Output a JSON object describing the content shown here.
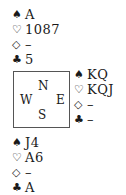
{
  "diagram": {
    "type": "bridge-deal",
    "compass": {
      "north": "N",
      "west": "W",
      "east": "E",
      "south": "S"
    },
    "suit_symbols": {
      "spades": "♠",
      "hearts": "♡",
      "diamonds": "◇",
      "clubs": "♣"
    },
    "hands": {
      "north": {
        "spades": "A",
        "hearts": "1087",
        "diamonds": "–",
        "clubs": "5"
      },
      "east": {
        "spades": "KQ",
        "hearts": "KQJ",
        "diamonds": "–",
        "clubs": "–"
      },
      "south": {
        "spades": "J4",
        "hearts": "A6",
        "diamonds": "–",
        "clubs": "A"
      }
    }
  }
}
